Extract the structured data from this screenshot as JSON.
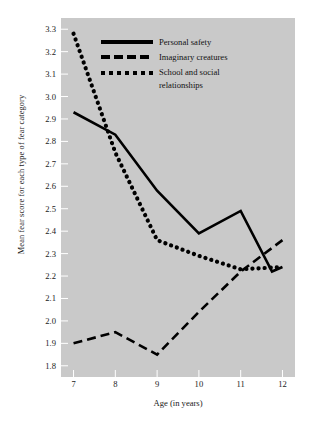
{
  "figure": {
    "background": "#ffffff",
    "panel_color": "#c9c9c9",
    "line_color": "#000000"
  },
  "chart_data": {
    "type": "line",
    "title": "",
    "xlabel": "Age (in years)",
    "ylabel": "Mean fear score for each type of fear category",
    "x": [
      7,
      8,
      9,
      10,
      11,
      12
    ],
    "xlim": [
      6.7,
      12.3
    ],
    "ylim": [
      1.75,
      3.35
    ],
    "xticks": [
      7,
      8,
      9,
      10,
      11,
      12
    ],
    "yticks": [
      1.8,
      1.9,
      2.0,
      2.1,
      2.2,
      2.3,
      2.4,
      2.5,
      2.6,
      2.7,
      2.8,
      2.9,
      3.0,
      3.1,
      3.2,
      3.3
    ],
    "ytick_labels": [
      "1.8",
      "1.9",
      "2.0",
      "2.1",
      "2.2",
      "2.3",
      "2.4",
      "2.5",
      "2.6",
      "2.7",
      "2.8",
      "2.9",
      "3.0",
      "3.1",
      "3.2",
      "3.3"
    ],
    "xtick_labels": [
      "7",
      "8",
      "9",
      "10",
      "11",
      "12"
    ],
    "grid": false,
    "legend_position": "upper center",
    "series": [
      {
        "name": "Personal safety",
        "style": "solid",
        "values": [
          2.93,
          2.83,
          2.58,
          2.39,
          2.49,
          2.24
        ],
        "extra_points": [
          {
            "x": 11.75,
            "y": 2.22
          }
        ]
      },
      {
        "name": "Imaginary creatures",
        "style": "dashed",
        "values": [
          1.9,
          1.95,
          1.85,
          2.04,
          2.22,
          2.36
        ]
      },
      {
        "name": "School and social relationships",
        "style": "dotted",
        "values": [
          3.28,
          2.75,
          2.36,
          2.29,
          2.23,
          2.24
        ]
      }
    ]
  },
  "legend": {
    "items": [
      {
        "label": "Personal safety",
        "style": "solid"
      },
      {
        "label": "Imaginary creatures",
        "style": "dashed"
      },
      {
        "label": "School and social relationships",
        "style": "dotted"
      }
    ]
  }
}
